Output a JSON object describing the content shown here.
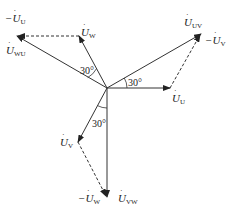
{
  "diagram": {
    "title": "",
    "phasors": [
      {
        "id": "U",
        "label": "U",
        "sub": "U",
        "prefix": "",
        "kind": "phase"
      },
      {
        "id": "V",
        "label": "U",
        "sub": "V",
        "prefix": "",
        "kind": "phase"
      },
      {
        "id": "W",
        "label": "U",
        "sub": "W",
        "prefix": "",
        "kind": "phase"
      },
      {
        "id": "UV",
        "label": "U",
        "sub": "UV",
        "prefix": "",
        "kind": "line"
      },
      {
        "id": "VW",
        "label": "U",
        "sub": "VW",
        "prefix": "",
        "kind": "line"
      },
      {
        "id": "WU",
        "label": "U",
        "sub": "WU",
        "prefix": "",
        "kind": "line"
      },
      {
        "id": "negV",
        "label": "U",
        "sub": "V",
        "prefix": "−",
        "kind": "negated"
      },
      {
        "id": "negW",
        "label": "U",
        "sub": "W",
        "prefix": "−",
        "kind": "negated"
      },
      {
        "id": "negU",
        "label": "U",
        "sub": "U",
        "prefix": "−",
        "kind": "negated"
      }
    ],
    "angles": [
      "30°",
      "30°",
      "30°"
    ],
    "relations": [
      "U_UV = U_U − U_V",
      "U_VW = U_V − U_W",
      "U_WU = U_W − U_U"
    ]
  }
}
